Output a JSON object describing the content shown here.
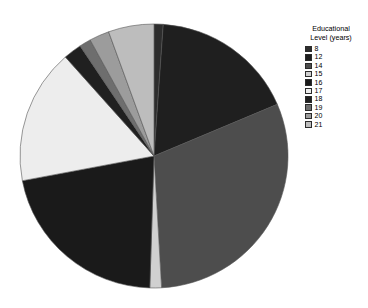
{
  "legend": {
    "title": "Educational\nLevel (years)",
    "position": "right"
  },
  "chart_data": {
    "type": "pie",
    "title": "",
    "legend_title": "Educational Level (years)",
    "legend_position": "right",
    "start_angle_deg": 0,
    "direction": "clockwise",
    "categories": [
      "8",
      "12",
      "14",
      "15",
      "16",
      "17",
      "18",
      "19",
      "20",
      "21"
    ],
    "values": [
      1.1,
      17.5,
      30.5,
      1.4,
      21.5,
      16.5,
      2.2,
      1.4,
      2.4,
      5.5
    ],
    "colors": [
      "#2d2d2d",
      "#1f1f1f",
      "#4d4d4d",
      "#d0d0d0",
      "#1a1a1a",
      "#ededed",
      "#202020",
      "#6e6e6e",
      "#9c9c9c",
      "#bdbdbd"
    ],
    "slices": [
      {
        "label": "8",
        "value": 1.1,
        "color": "#2d2d2d"
      },
      {
        "label": "12",
        "value": 17.5,
        "color": "#1f1f1f"
      },
      {
        "label": "14",
        "value": 30.5,
        "color": "#4d4d4d"
      },
      {
        "label": "15",
        "value": 1.4,
        "color": "#d0d0d0"
      },
      {
        "label": "16",
        "value": 21.5,
        "color": "#1a1a1a"
      },
      {
        "label": "17",
        "value": 16.5,
        "color": "#ededed"
      },
      {
        "label": "18",
        "value": 2.2,
        "color": "#202020"
      },
      {
        "label": "19",
        "value": 1.4,
        "color": "#6e6e6e"
      },
      {
        "label": "20",
        "value": 2.4,
        "color": "#9c9c9c"
      },
      {
        "label": "21",
        "value": 5.5,
        "color": "#bdbdbd"
      }
    ],
    "xlabel": "",
    "ylabel": ""
  }
}
